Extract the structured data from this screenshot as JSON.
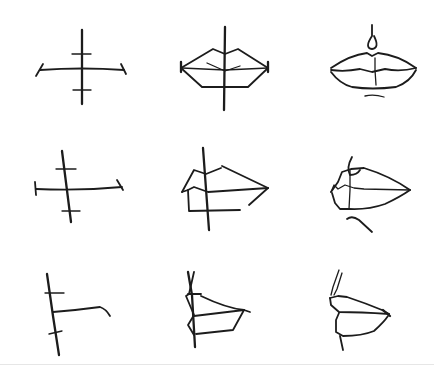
{
  "figure": {
    "background": "#ffffff",
    "ink_color": "#1c1c1c",
    "rule_color": "#e6e6e6",
    "rows": [
      {
        "view": "front",
        "cells": [
          {
            "stage": "guidelines",
            "strokes": [
              {
                "w": "thick",
                "d": "M82 30 L82 104"
              },
              {
                "w": "med",
                "d": "M40 70 Q82 67 124 70"
              },
              {
                "w": "med",
                "d": "M36 76 L43 64"
              },
              {
                "w": "med",
                "d": "M121 64 L126 74"
              },
              {
                "w": "thin",
                "d": "M72 54 L91 54"
              },
              {
                "w": "thin",
                "d": "M73 90 L91 90"
              }
            ]
          },
          {
            "stage": "block-in",
            "strokes": [
              {
                "w": "thick",
                "d": "M225 27 L224 110"
              },
              {
                "w": "med",
                "d": "M181 68 L213 49 L225 54 L238 49 L268 68"
              },
              {
                "w": "med",
                "d": "M181 68 L202 87 L248 87 L268 68"
              },
              {
                "w": "thin",
                "d": "M182 68 L225 70 L268 68"
              },
              {
                "w": "thin",
                "d": "M207 63 L225 71 L240 66"
              },
              {
                "w": "thick",
                "d": "M181 62 L181 72"
              },
              {
                "w": "thick",
                "d": "M268 62 L268 72"
              }
            ]
          },
          {
            "stage": "refined",
            "strokes": [
              {
                "w": "med",
                "d": "M372 25 L372 36 Q364 48 372 49 Q380 48 374 36"
              },
              {
                "w": "med",
                "d": "M331 68 Q350 55 367 53 L372 56 L378 53 Q398 55 416 68"
              },
              {
                "w": "med",
                "d": "M331 70 Q345 72 360 69 L372 72 L385 69 Q400 72 416 68"
              },
              {
                "w": "thin",
                "d": "M375 58 L375 70 L376 85"
              },
              {
                "w": "med",
                "d": "M331 72 Q340 84 352 87 Q372 90 396 87 Q410 82 416 70"
              },
              {
                "w": "thin",
                "d": "M365 96 Q374 94 384 97"
              }
            ]
          }
        ]
      },
      {
        "view": "three-quarter",
        "cells": [
          {
            "stage": "guidelines",
            "strokes": [
              {
                "w": "thick",
                "d": "M62 151 L71 222"
              },
              {
                "w": "med",
                "d": "M36 189 Q80 191 122 187"
              },
              {
                "w": "med",
                "d": "M35 182 L36 195"
              },
              {
                "w": "med",
                "d": "M117 180 L123 190"
              },
              {
                "w": "thin",
                "d": "M56 169 L76 169"
              },
              {
                "w": "thin",
                "d": "M62 211 L80 211"
              }
            ]
          },
          {
            "stage": "block-in",
            "strokes": [
              {
                "w": "thick",
                "d": "M203 148 L209 230"
              },
              {
                "w": "med",
                "d": "M182 192 L194 170 L206 174 L221 168"
              },
              {
                "w": "med",
                "d": "M222 166 L268 188"
              },
              {
                "w": "med",
                "d": "M182 192 L188 190 L194 187 L208 192 L268 188"
              },
              {
                "w": "med",
                "d": "M188 190 L189 211 L240 210"
              },
              {
                "w": "med",
                "d": "M268 188 L249 205"
              }
            ]
          },
          {
            "stage": "refined",
            "strokes": [
              {
                "w": "med",
                "d": "M352 157 Q346 168 350 175 Q357 175 360 170"
              },
              {
                "w": "med",
                "d": "M331 192 L338 182 L342 172 L351 169 L364 168 Q390 176 410 190"
              },
              {
                "w": "thin",
                "d": "M331 192 L334 185 L338 189 L345 185 L354 188 L364 189 L410 190"
              },
              {
                "w": "thin",
                "d": "M350 170 L350 190 L349 209"
              },
              {
                "w": "med",
                "d": "M332 193 L335 203 L340 209 L349 209 Q368 210 385 204 Q400 197 410 190"
              },
              {
                "w": "med",
                "d": "M347 219 Q352 215 359 220 L372 232"
              }
            ]
          }
        ]
      },
      {
        "view": "profile",
        "cells": [
          {
            "stage": "guidelines",
            "strokes": [
              {
                "w": "thick",
                "d": "M47 274 L53 316 L59 355"
              },
              {
                "w": "med",
                "d": "M53 312 Q78 310 100 307 Q106 309 110 316"
              },
              {
                "w": "thin",
                "d": "M45 293 L64 293"
              },
              {
                "w": "thin",
                "d": "M49 334 L62 331"
              }
            ]
          },
          {
            "stage": "block-in",
            "strokes": [
              {
                "w": "thick",
                "d": "M188 272 L192 295 L195 347"
              },
              {
                "w": "med",
                "d": "M194 272 L189 294 L186 296 L194 315 L188 325 L194 335"
              },
              {
                "w": "med",
                "d": "M188 294 L201 294"
              },
              {
                "w": "med",
                "d": "M201 296 Q226 308 244 310"
              },
              {
                "w": "med",
                "d": "M194 316 L244 310 L250 312"
              },
              {
                "w": "med",
                "d": "M244 310 L233 330 L196 334"
              }
            ]
          },
          {
            "stage": "refined",
            "strokes": [
              {
                "w": "thin",
                "d": "M339 270 L333 287 L331 295"
              },
              {
                "w": "thin",
                "d": "M342 273 L337 289 L334 295"
              },
              {
                "w": "med",
                "d": "M330 298 L338 296 L347 297 Q365 303 382 310 L389 314"
              },
              {
                "w": "med",
                "d": "M330 298 L331 305 L339 312 Q360 312 389 314"
              },
              {
                "w": "med",
                "d": "M339 313 L336 320 L336 332 L343 336 Q362 336 374 331 Q384 322 388 316"
              },
              {
                "w": "med",
                "d": "M340 336 L343 350"
              },
              {
                "w": "thick",
                "d": "M383 310 L390 316"
              }
            ]
          }
        ]
      }
    ]
  }
}
